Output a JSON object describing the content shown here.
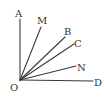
{
  "diagram": {
    "vertex": {
      "label": "O",
      "x": 20,
      "y": 80,
      "label_x": 11,
      "label_y": 91
    },
    "rays": [
      {
        "label": "A",
        "end_x": 20,
        "end_y": 19,
        "label_x": 15,
        "label_y": 17
      },
      {
        "label": "M",
        "end_x": 41,
        "end_y": 27,
        "label_x": 38,
        "label_y": 24
      },
      {
        "label": "B",
        "end_x": 65,
        "end_y": 37,
        "label_x": 65,
        "label_y": 35
      },
      {
        "label": "C",
        "end_x": 74,
        "end_y": 44,
        "label_x": 75,
        "label_y": 47
      },
      {
        "label": "N",
        "end_x": 76,
        "end_y": 66,
        "label_x": 78,
        "label_y": 71
      },
      {
        "label": "D",
        "end_x": 93,
        "end_y": 81,
        "label_x": 94,
        "label_y": 86
      }
    ],
    "colors": {
      "line": "#3a3a3a",
      "text": "#333333",
      "background": "#ffffff"
    }
  }
}
